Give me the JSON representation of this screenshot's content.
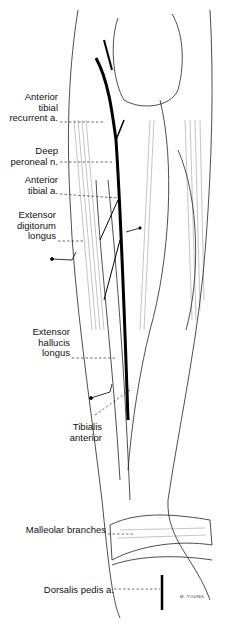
{
  "figure": {
    "signature": "M. YOUNG"
  },
  "labels": [
    {
      "id": "anterior-tibial-recurrent",
      "text": "Anterior\ntibial\nrecurrent a.",
      "x": 2,
      "y": 92,
      "w": 56
    },
    {
      "id": "deep-peroneal",
      "text": "Deep\nperoneal n.",
      "x": 2,
      "y": 146,
      "w": 56
    },
    {
      "id": "anterior-tibial-artery",
      "text": "Anterior\ntibial a.",
      "x": 2,
      "y": 175,
      "w": 56
    },
    {
      "id": "extensor-digitorum-longus",
      "text": "Extensor\ndigitorum\nlongus",
      "x": 2,
      "y": 210,
      "w": 54
    },
    {
      "id": "extensor-hallucis-longus",
      "text": "Extensor\nhallucis\nlongus",
      "x": 2,
      "y": 327,
      "w": 68
    },
    {
      "id": "tibialis-anterior",
      "text": "Tibialis\nanterior",
      "x": 2,
      "y": 422,
      "w": 100
    },
    {
      "id": "malleolar-branches",
      "text": "Malleolar branches",
      "x": 2,
      "y": 525,
      "w": 104
    },
    {
      "id": "dorsalis-pedis",
      "text": "Dorsalis pedis a.",
      "x": 2,
      "y": 585,
      "w": 112
    }
  ],
  "colors": {
    "ink": "#111111",
    "paper": "#ffffff"
  }
}
